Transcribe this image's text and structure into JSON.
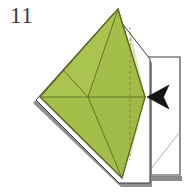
{
  "figure": {
    "kind": "origami-instruction-diagram",
    "step_number": "11",
    "background_color": "#ffffff"
  },
  "colors": {
    "paper_green_fill": "#a3bf4a",
    "paper_green_fill_light": "#aecb56",
    "paper_green_fill_dark": "#98b543",
    "paper_outline": "#4d5a1e",
    "fold_line": "#5c6b22",
    "valley_fold_dashed": "#9a6b4a",
    "white_paper_fill": "#ffffff",
    "white_paper_outline": "#3a3a3a",
    "white_paper_outline_soft": "#b9b9b9",
    "shadow_gray": "#7a7a7a",
    "arrow_black": "#141414",
    "step_number_color": "#3b3b3b"
  },
  "shapes": {
    "back_white_layer": {
      "name": "white-back-layer",
      "points": "114,14 36,100 119,184 150,184 150,60"
    },
    "right_white_panel": {
      "name": "white-side-panel",
      "points": "146,57 180,57 180,175 146,175"
    },
    "right_panel_shadow": {
      "points": "149,176 182,176 182,180 149,180"
    },
    "green_kite": {
      "name": "green-paper-kite",
      "points": "118,9 40,97 122,178 145,97"
    },
    "arrow": {
      "name": "fold-direction-arrow",
      "points": "148,97 168,86 163,97 168,108"
    }
  },
  "fold_lines": [
    {
      "name": "horizontal-center-crease",
      "x1": 41,
      "y1": 97,
      "x2": 145,
      "y2": 97,
      "style": "solid"
    },
    {
      "name": "left-upper-crease",
      "x1": 118,
      "y1": 9,
      "x2": 88,
      "y2": 97,
      "style": "solid"
    },
    {
      "name": "left-lower-crease",
      "x1": 88,
      "y1": 97,
      "x2": 122,
      "y2": 178,
      "style": "solid"
    },
    {
      "name": "upper-right-crease",
      "x1": 118,
      "y1": 9,
      "x2": 145,
      "y2": 97,
      "style": "solid"
    },
    {
      "name": "lower-right-crease",
      "x1": 145,
      "y1": 97,
      "x2": 122,
      "y2": 178,
      "style": "solid"
    },
    {
      "name": "upper-left-edge-crease",
      "x1": 118,
      "y1": 9,
      "x2": 40,
      "y2": 97,
      "style": "solid"
    },
    {
      "name": "lower-left-edge-crease",
      "x1": 40,
      "y1": 97,
      "x2": 122,
      "y2": 178,
      "style": "solid"
    },
    {
      "name": "short-diagonal-crease",
      "x1": 88,
      "y1": 97,
      "x2": 63,
      "y2": 70,
      "style": "solid"
    },
    {
      "name": "vertical-valley-fold",
      "x1": 130,
      "y1": 27,
      "x2": 130,
      "y2": 160,
      "style": "dashed"
    }
  ],
  "panel_detail_line": {
    "name": "panel-diagonal-crease",
    "x1": 150,
    "y1": 170,
    "x2": 179,
    "y2": 133
  },
  "labels": {
    "step_number_text": "11"
  }
}
